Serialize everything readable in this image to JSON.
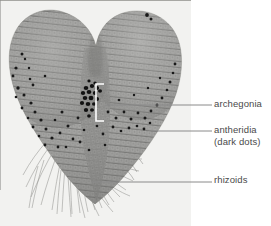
{
  "figure": {
    "kind": "labeled-micrograph",
    "photo_background_color": "#f2f2f0",
    "tissue_color": "#9a9a98",
    "dot_color": "#1c1c1c",
    "leader_line_color": "#8a8a8a",
    "label_text_color": "#4a4a4a",
    "bracket_color": "#ffffff"
  },
  "labels": [
    {
      "id": "archegonia",
      "text": "archegonia",
      "sub": "",
      "leader": {
        "x1": 105,
        "y1": 105,
        "x2": 212,
        "y2": 105
      },
      "marker": "bracket"
    },
    {
      "id": "antheridia",
      "text": "antheridia",
      "sub": "(dark dots)",
      "leader": {
        "x1": 152,
        "y1": 131,
        "x2": 212,
        "y2": 131
      },
      "marker": "line"
    },
    {
      "id": "rhizoids",
      "text": "rhizoids",
      "sub": "",
      "leader": {
        "x1": 92,
        "y1": 182,
        "x2": 212,
        "y2": 182
      },
      "marker": "line"
    }
  ],
  "bracket": {
    "x": 95,
    "y": 84,
    "width": 9,
    "height": 37
  }
}
